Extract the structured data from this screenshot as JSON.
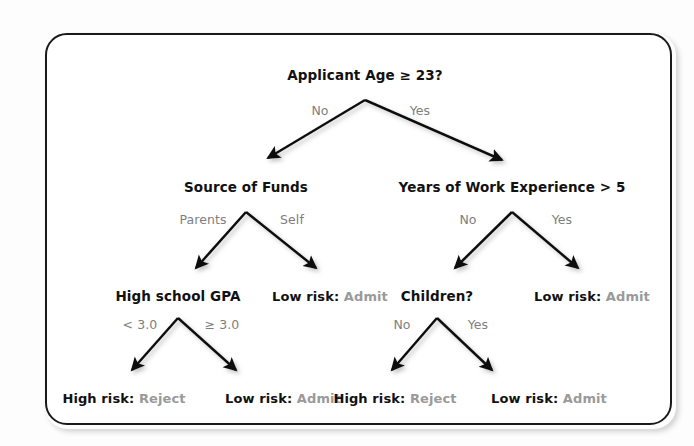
{
  "diagram": {
    "type": "decision-tree",
    "colors": {
      "node_text": "#111111",
      "leaf_value": "#9a9a9a",
      "edge_label": "#7e7e7e",
      "arrow": "#111111",
      "frame_border": "#1a1a1a",
      "background": "#ffffff"
    },
    "nodes": [
      {
        "id": "root",
        "label": "Applicant Age ≥ 23?",
        "kind": "decision",
        "x": 365,
        "y": 75
      },
      {
        "id": "funds",
        "label": "Source of Funds",
        "kind": "decision",
        "x": 246,
        "y": 187
      },
      {
        "id": "work",
        "label": "Years of Work Experience > 5",
        "kind": "decision",
        "x": 512,
        "y": 187
      },
      {
        "id": "gpa",
        "label": "High school GPA",
        "kind": "decision",
        "x": 178,
        "y": 296
      },
      {
        "id": "children",
        "label": "Children?",
        "kind": "decision",
        "x": 437,
        "y": 296
      }
    ],
    "leaves": [
      {
        "id": "leaf-self",
        "risk": "Low risk:",
        "action": "Admit",
        "x": 330,
        "y": 296
      },
      {
        "id": "leaf-work-yes",
        "risk": "Low risk:",
        "action": "Admit",
        "x": 592,
        "y": 296
      },
      {
        "id": "leaf-gpa-low",
        "risk": "High risk:",
        "action": "Reject",
        "x": 124,
        "y": 398
      },
      {
        "id": "leaf-gpa-high",
        "risk": "Low risk:",
        "action": "Admit",
        "x": 283,
        "y": 398
      },
      {
        "id": "leaf-kids-no",
        "risk": "High risk:",
        "action": "Reject",
        "x": 395,
        "y": 398
      },
      {
        "id": "leaf-kids-yes",
        "risk": "Low risk:",
        "action": "Admit",
        "x": 549,
        "y": 398
      }
    ],
    "edges": [
      {
        "id": "e-root-no",
        "label": "No",
        "from": [
          365,
          100
        ],
        "to": [
          268,
          158
        ],
        "label_x": 320,
        "label_y": 110
      },
      {
        "id": "e-root-yes",
        "label": "Yes",
        "from": [
          365,
          100
        ],
        "to": [
          502,
          160
        ],
        "label_x": 420,
        "label_y": 110
      },
      {
        "id": "e-funds-par",
        "label": "Parents",
        "from": [
          246,
          212
        ],
        "to": [
          196,
          268
        ],
        "label_x": 203,
        "label_y": 219
      },
      {
        "id": "e-funds-self",
        "label": "Self",
        "from": [
          246,
          212
        ],
        "to": [
          316,
          268
        ],
        "label_x": 292,
        "label_y": 219
      },
      {
        "id": "e-work-no",
        "label": "No",
        "from": [
          512,
          212
        ],
        "to": [
          455,
          268
        ],
        "label_x": 468,
        "label_y": 219
      },
      {
        "id": "e-work-yes",
        "label": "Yes",
        "from": [
          512,
          212
        ],
        "to": [
          578,
          268
        ],
        "label_x": 562,
        "label_y": 219
      },
      {
        "id": "e-gpa-low",
        "label": "< 3.0",
        "from": [
          178,
          318
        ],
        "to": [
          132,
          370
        ],
        "label_x": 140,
        "label_y": 324
      },
      {
        "id": "e-gpa-high",
        "label": "≥ 3.0",
        "from": [
          178,
          318
        ],
        "to": [
          236,
          370
        ],
        "label_x": 222,
        "label_y": 324
      },
      {
        "id": "e-kids-no",
        "label": "No",
        "from": [
          437,
          318
        ],
        "to": [
          392,
          370
        ],
        "label_x": 402,
        "label_y": 324
      },
      {
        "id": "e-kids-yes",
        "label": "Yes",
        "from": [
          437,
          318
        ],
        "to": [
          492,
          370
        ],
        "label_x": 478,
        "label_y": 324
      }
    ]
  }
}
